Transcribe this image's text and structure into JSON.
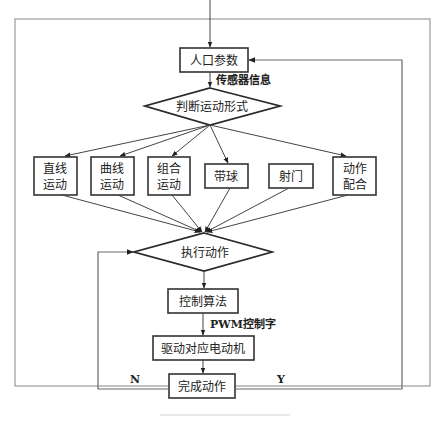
{
  "figure": {
    "type": "flowchart",
    "caption": "",
    "nodes": {
      "input_params": "人口参数",
      "judge_motion": "判断运动形式",
      "execute_action": "执行动作",
      "control_algorithm": "控制算法",
      "drive_motor": "驱动对应电动机",
      "complete_action": "完成动作"
    },
    "motion_types": [
      {
        "line1": "直线",
        "line2": "运动"
      },
      {
        "line1": "曲线",
        "line2": "运动"
      },
      {
        "line1": "组合",
        "line2": "运动"
      },
      {
        "line1": "带球",
        "line2": ""
      },
      {
        "line1": "射门",
        "line2": ""
      },
      {
        "line1": "动作",
        "line2": "配合"
      }
    ],
    "edge_labels": {
      "sensor_info": "传感器信息",
      "pwm_word": "PWM控制字",
      "no": "N",
      "yes": "Y"
    },
    "colors": {
      "stroke": "#333333",
      "frame": "#9a9a9a",
      "background": "#ffffff"
    }
  }
}
